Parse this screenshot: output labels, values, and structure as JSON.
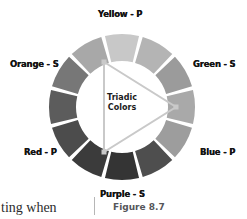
{
  "figure": {
    "caption": "Figure 8.7",
    "center_title_line1": "Triadic",
    "center_title_line2": "Colors"
  },
  "body_text_fragment": "ting when",
  "wheel": {
    "center": {
      "x": 122,
      "y": 107
    },
    "outer_radius": 73,
    "inner_radius": 46,
    "segment_count": 12,
    "gap_degrees": 3,
    "labels": [
      {
        "id": "yellow",
        "text": "Yellow - P",
        "angle_deg": 270
      },
      {
        "id": "orange",
        "text": "Orange - S",
        "angle_deg": 210
      },
      {
        "id": "red",
        "text": "Red - P",
        "angle_deg": 150
      },
      {
        "id": "purple",
        "text": "Purple - S",
        "angle_deg": 90
      },
      {
        "id": "blue",
        "text": "Blue - P",
        "angle_deg": 30
      },
      {
        "id": "green",
        "text": "Green - S",
        "angle_deg": 330
      }
    ],
    "segments": [
      {
        "index": 0,
        "name": "yellow",
        "fill": "#c8c8c8"
      },
      {
        "index": 1,
        "name": "yellow-green",
        "fill": "#b4b4b4"
      },
      {
        "index": 2,
        "name": "green",
        "fill": "#9b9b9b"
      },
      {
        "index": 3,
        "name": "blue-green",
        "fill": "#a9a9a9"
      },
      {
        "index": 4,
        "name": "blue",
        "fill": "#9d9d9d"
      },
      {
        "index": 5,
        "name": "blue-purple",
        "fill": "#4e4e4e"
      },
      {
        "index": 6,
        "name": "purple",
        "fill": "#343434"
      },
      {
        "index": 7,
        "name": "red-purple",
        "fill": "#3b3b3b"
      },
      {
        "index": 8,
        "name": "red",
        "fill": "#4c4c4c"
      },
      {
        "index": 9,
        "name": "red-orange",
        "fill": "#5c5c5c"
      },
      {
        "index": 10,
        "name": "orange",
        "fill": "#777777"
      },
      {
        "index": 11,
        "name": "yellow-orange",
        "fill": "#a8a8a8"
      }
    ]
  },
  "triangle": {
    "stroke": "#c9c9c9",
    "vertices": [
      {
        "label": "yellow-vertex",
        "x": 104,
        "y": 62
      },
      {
        "label": "blue-vertex",
        "x": 176,
        "y": 107
      },
      {
        "label": "red-vertex",
        "x": 104,
        "y": 152
      }
    ]
  },
  "colors": {
    "background": "#ffffff",
    "label_text": "#151515",
    "caption_text": "#55565a",
    "ring_gap": "#ffffff"
  }
}
